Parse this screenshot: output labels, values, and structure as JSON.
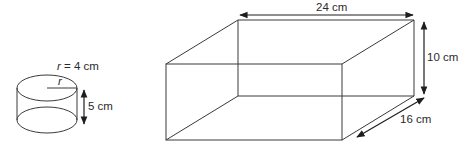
{
  "cylinder": {
    "radius_label_var": "r",
    "radius_label_rest": " = 4 cm",
    "radius_marker": "r",
    "height_label": "5 cm"
  },
  "cuboid": {
    "length_label": "24 cm",
    "height_label": "10 cm",
    "depth_label": "16 cm"
  }
}
